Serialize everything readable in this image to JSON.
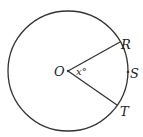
{
  "diagram": {
    "type": "circle-central-angle",
    "circle": {
      "cx": 68,
      "cy": 71,
      "r": 60,
      "stroke": "#333333"
    },
    "center": {
      "label": "O",
      "x": 68,
      "y": 71
    },
    "points": [
      {
        "label": "R",
        "x": 120,
        "y": 42
      },
      {
        "label": "S",
        "x": 128,
        "y": 72
      },
      {
        "label": "T",
        "x": 117,
        "y": 105
      }
    ],
    "angle_label": "x°",
    "segments": [
      {
        "from": "O",
        "to": "R"
      },
      {
        "from": "O",
        "to": "T"
      }
    ]
  }
}
